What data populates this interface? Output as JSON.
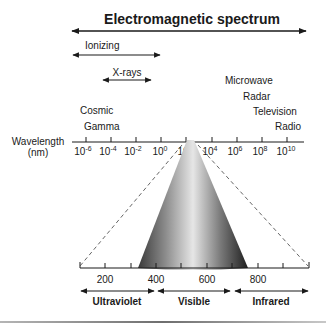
{
  "title": "Electromagnetic spectrum",
  "ranges": {
    "ionizing": "Ionizing",
    "xrays": "X-rays"
  },
  "region_labels": {
    "cosmic": "Cosmic",
    "gamma": "Gamma",
    "microwave": "Microwave",
    "radar": "Radar",
    "television": "Television",
    "radio": "Radio"
  },
  "wavelength_axis": {
    "label_line1": "Wavelength",
    "label_line2": "(nm)",
    "ticks": [
      {
        "base": "10",
        "exp": "-6"
      },
      {
        "base": "10",
        "exp": "-4"
      },
      {
        "base": "10",
        "exp": "-2"
      },
      {
        "base": "10",
        "exp": "0"
      },
      {
        "base": "10",
        "exp": "2"
      },
      {
        "base": "10",
        "exp": "4"
      },
      {
        "base": "10",
        "exp": "6"
      },
      {
        "base": "10",
        "exp": "8"
      },
      {
        "base": "10",
        "exp": "10"
      }
    ]
  },
  "zoom_axis": {
    "ticks": [
      "200",
      "400",
      "600",
      "800"
    ]
  },
  "bands": {
    "ultraviolet": "Ultraviolet",
    "visible": "Visible",
    "infrared": "Infrared"
  },
  "colors": {
    "ink": "#1a1a1a",
    "dash": "#555555",
    "bottom_rule": "#9a9a9a"
  }
}
